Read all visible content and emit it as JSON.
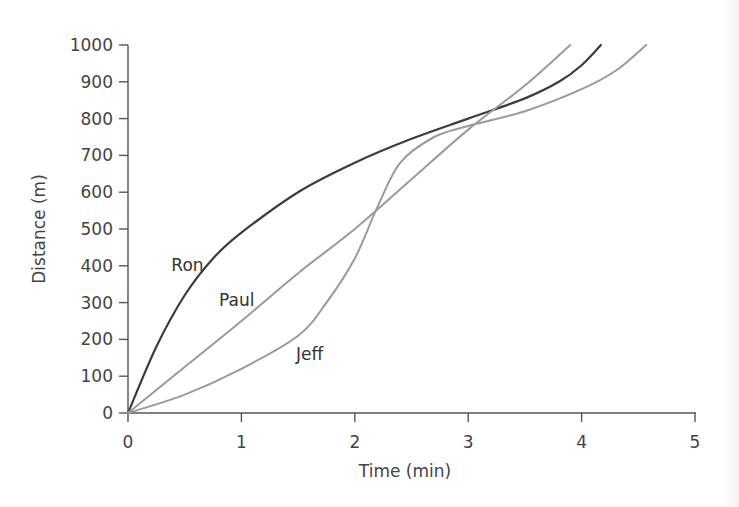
{
  "chart_data": {
    "type": "line",
    "title": "",
    "xlabel": "Time (min)",
    "ylabel": "Distance (m)",
    "xlim": [
      0,
      5
    ],
    "ylim": [
      0,
      1000
    ],
    "x_ticks": [
      "0",
      "1",
      "2",
      "3",
      "4",
      "5"
    ],
    "y_ticks": [
      "0",
      "100",
      "200",
      "300",
      "400",
      "500",
      "600",
      "700",
      "800",
      "900",
      "1000"
    ],
    "grid": false,
    "legend": "inline labels",
    "series": [
      {
        "name": "Ron",
        "color": "#3c3c3c",
        "points": [
          [
            0,
            0
          ],
          [
            0.25,
            180
          ],
          [
            0.5,
            320
          ],
          [
            0.75,
            420
          ],
          [
            1,
            490
          ],
          [
            1.5,
            600
          ],
          [
            2,
            680
          ],
          [
            2.5,
            745
          ],
          [
            3,
            800
          ],
          [
            3.5,
            855
          ],
          [
            3.8,
            900
          ],
          [
            4,
            945
          ],
          [
            4.17,
            1000
          ]
        ]
      },
      {
        "name": "Paul",
        "color": "#9a9a9a",
        "points": [
          [
            0,
            0
          ],
          [
            0.5,
            125
          ],
          [
            1,
            250
          ],
          [
            1.5,
            380
          ],
          [
            2,
            500
          ],
          [
            2.5,
            635
          ],
          [
            3,
            770
          ],
          [
            3.5,
            890
          ],
          [
            3.9,
            1000
          ]
        ]
      },
      {
        "name": "Jeff",
        "color": "#9a9a9a",
        "points": [
          [
            0,
            0
          ],
          [
            0.5,
            50
          ],
          [
            1,
            120
          ],
          [
            1.5,
            210
          ],
          [
            1.75,
            300
          ],
          [
            2,
            420
          ],
          [
            2.2,
            560
          ],
          [
            2.4,
            680
          ],
          [
            2.7,
            750
          ],
          [
            3,
            780
          ],
          [
            3.5,
            820
          ],
          [
            4,
            880
          ],
          [
            4.3,
            930
          ],
          [
            4.57,
            1000
          ]
        ]
      }
    ],
    "annotations": [
      {
        "text": "Ron",
        "x": 0.4,
        "y": 390
      },
      {
        "text": "Paul",
        "x": 0.82,
        "y": 295
      },
      {
        "text": "Jeff",
        "x": 1.5,
        "y": 150
      }
    ]
  }
}
